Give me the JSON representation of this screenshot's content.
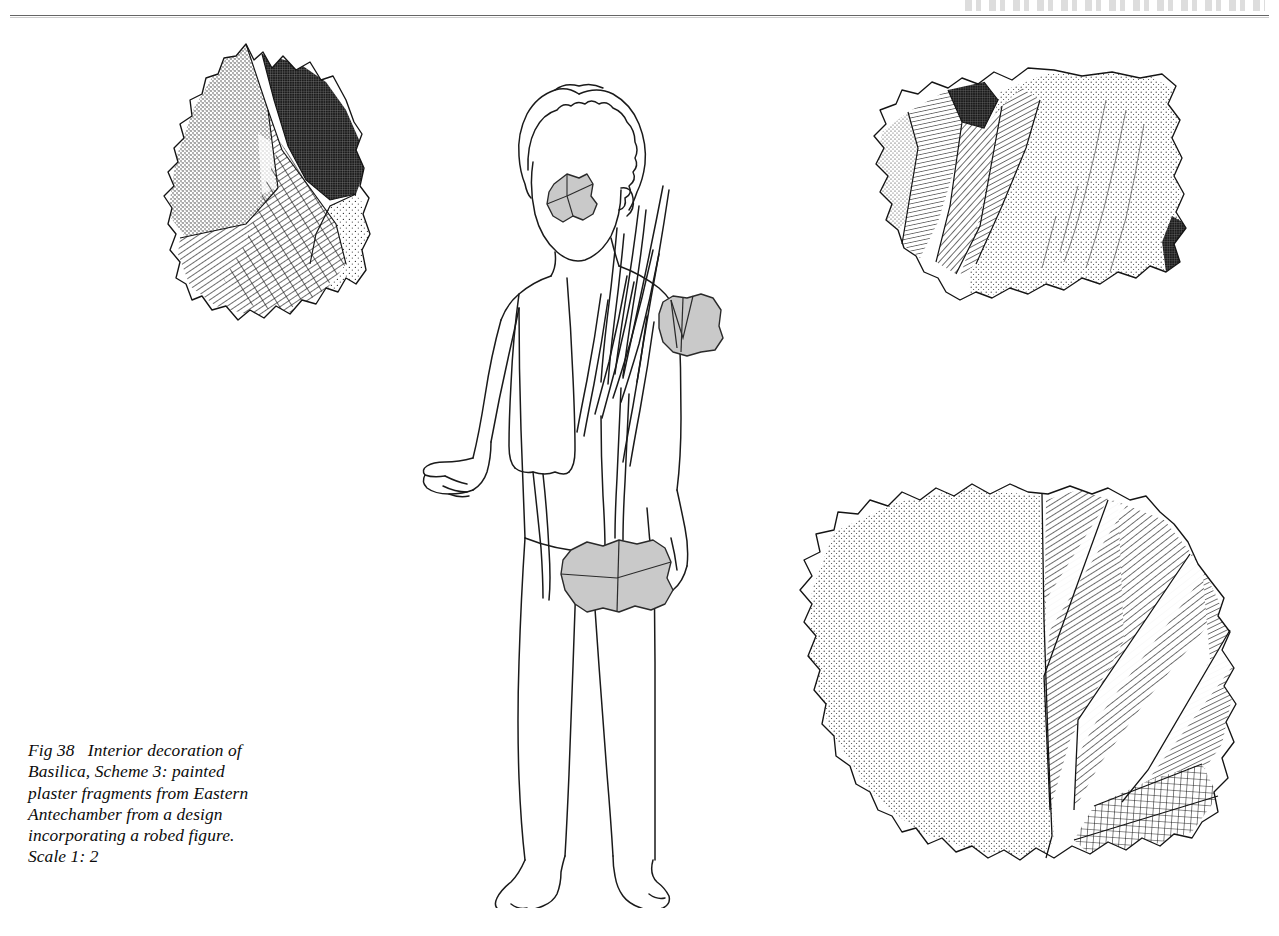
{
  "page": {
    "width": 1279,
    "height": 936,
    "background": "#ffffff",
    "ink": "#111111",
    "rule_color": "#4a4a4a",
    "fragment_grey": "#c8c8c8",
    "has_top_rule": true
  },
  "caption": {
    "full_text": "Fig 38   Interior decoration of Basilica, Scheme 3: painted plaster fragments from Eastern Antechamber from a design incorporating a robed figure. Scale 1: 2",
    "figure_number": "Fig 38",
    "scale": "Scale 1: 2",
    "lines": [
      "Fig 38   Interior decoration of",
      "Basilica, Scheme 3: painted",
      "plaster fragments from Eastern",
      "Antechamber from a design",
      "incorporating a robed figure.",
      "Scale 1: 2"
    ]
  },
  "illustration": {
    "title": "Interior decoration of Basilica, Scheme 3",
    "subject": "painted plaster fragments from Eastern Antechamber",
    "design": "a design incorporating a robed figure",
    "scale": "1: 2",
    "fragment_count": 3,
    "reconstruction_patch_count": 3
  },
  "fragments": [
    {
      "id": "fragment-top-left",
      "label": "Fragment A",
      "position": {
        "x": 150,
        "y": 40,
        "width": 250,
        "height": 290
      },
      "zones": [
        {
          "name": "medium-stipple",
          "description": "medium density stipple, upper left triangular facet"
        },
        {
          "name": "dense-crosshatch-dark",
          "description": "near-solid dark fine crosshatch, upper right"
        },
        {
          "name": "diagonal-hatch",
          "description": "ruled diagonal hatching, lower left and centre"
        },
        {
          "name": "crossed-diagonal-band",
          "description": "second diagonal ruling crossing the hatch, lower centre"
        },
        {
          "name": "light-stipple",
          "description": "sparse stipple, right lower facet"
        }
      ]
    },
    {
      "id": "fragment-top-right",
      "label": "Fragment B",
      "position": {
        "x": 852,
        "y": 70,
        "width": 330,
        "height": 250
      },
      "zones": [
        {
          "name": "light-stipple-edge",
          "description": "sparse stipple at the broken left edge"
        },
        {
          "name": "fine-hatch-band",
          "description": "fine vertical-leaning hatch band"
        },
        {
          "name": "dense-crosshatch-dark",
          "description": "dark crosshatch patch, upper left of centre"
        },
        {
          "name": "diagonal-hatch-fold",
          "description": "ruled diagonal hatching forming drapery fold bands"
        },
        {
          "name": "broad-stipple-field",
          "description": "large open stipple field with curving fold streaks, right two-thirds"
        },
        {
          "name": "dark-crosshatch-corner",
          "description": "small dark crosshatch at right edge"
        }
      ]
    },
    {
      "id": "fragment-bottom-right",
      "label": "Fragment C",
      "position": {
        "x": 782,
        "y": 485,
        "width": 460,
        "height": 425
      },
      "zones": [
        {
          "name": "broad-stipple-field",
          "description": "large even stipple field occupying the left half"
        },
        {
          "name": "diagonal-hatch-bands",
          "description": "several ruled diagonal hatch bands running upper-right to lower-left"
        },
        {
          "name": "open-crosshatch-grid",
          "description": "coarse open square crosshatch grid, lower right"
        }
      ]
    }
  ],
  "figure_drawing": {
    "id": "robed-figure",
    "description": "outline reconstruction of a standing robed figure",
    "features": [
      "curly hair",
      "featureless face",
      "open right hand, palm up, gesturing",
      "robe draped over left shoulder",
      "pointed cascading drapery folds at the figure's left side",
      "bare legs",
      "bare feet"
    ],
    "patches": [
      {
        "id": "patch-shoulder",
        "label": "shoulder fragment",
        "fill": "#c8c8c8"
      },
      {
        "id": "patch-arm",
        "label": "upper arm fragment",
        "fill": "#c8c8c8"
      },
      {
        "id": "patch-hip",
        "label": "hip fragment",
        "fill": "#c8c8c8"
      }
    ]
  }
}
